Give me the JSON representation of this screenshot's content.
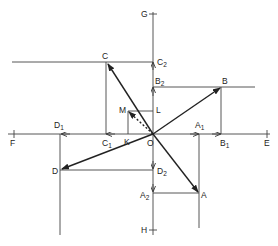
{
  "diagram": {
    "type": "vector-resolution",
    "origin": {
      "label": "O",
      "x": 153,
      "y": 134
    },
    "axes": {
      "horizontal": {
        "left_label": "F",
        "right_label": "E"
      },
      "vertical": {
        "top_label": "G",
        "bottom_label": "H"
      }
    },
    "vectors": [
      {
        "label": "A",
        "x": 199,
        "y": 193,
        "x_proj": "A1",
        "y_proj": "A2"
      },
      {
        "label": "B",
        "x": 221,
        "y": 87,
        "x_proj": "B1",
        "y_proj": "B2"
      },
      {
        "label": "C",
        "x": 107,
        "y": 63,
        "x_proj": "C1",
        "y_proj": "C2"
      },
      {
        "label": "D",
        "x": 61,
        "y": 170,
        "x_proj": "D1",
        "y_proj": "D2"
      }
    ],
    "resultant": {
      "label": "M",
      "x": 128,
      "y": 112,
      "x_proj": "K",
      "y_proj": "L",
      "style": "dashed"
    },
    "labels": {
      "O": "O",
      "F": "F",
      "E": "E",
      "G": "G",
      "H": "H",
      "A": "A",
      "B": "B",
      "C": "C",
      "D": "D",
      "M": "M",
      "K": "K",
      "L": "L",
      "A1_main": "A",
      "A1_sub": "1",
      "A2_main": "A",
      "A2_sub": "2",
      "B1_main": "B",
      "B1_sub": "1",
      "B2_main": "B",
      "B2_sub": "2",
      "C1_main": "C",
      "C1_sub": "1",
      "C2_main": "C",
      "C2_sub": "2",
      "D1_main": "D",
      "D1_sub": "1",
      "D2_main": "D",
      "D2_sub": "2"
    }
  }
}
